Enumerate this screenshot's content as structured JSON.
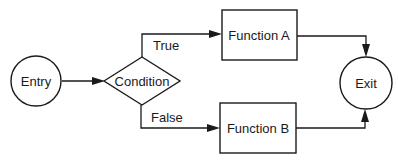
{
  "diagram": {
    "type": "flowchart",
    "nodes": {
      "entry": {
        "label": "Entry",
        "shape": "circle"
      },
      "condition": {
        "label": "Condition",
        "shape": "diamond"
      },
      "function_a": {
        "label": "Function A",
        "shape": "rectangle"
      },
      "function_b": {
        "label": "Function B",
        "shape": "rectangle"
      },
      "exit": {
        "label": "Exit",
        "shape": "circle"
      }
    },
    "edges": {
      "entry_to_condition": {
        "from": "Entry",
        "to": "Condition",
        "label": ""
      },
      "true_branch": {
        "from": "Condition",
        "to": "Function A",
        "label": "True"
      },
      "false_branch": {
        "from": "Condition",
        "to": "Function B",
        "label": "False"
      },
      "a_to_exit": {
        "from": "Function A",
        "to": "Exit",
        "label": ""
      },
      "b_to_exit": {
        "from": "Function B",
        "to": "Exit",
        "label": ""
      }
    },
    "colors": {
      "stroke": "#1a1a1a",
      "background": "#ffffff"
    }
  }
}
